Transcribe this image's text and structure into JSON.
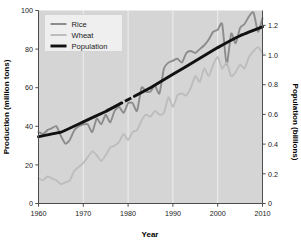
{
  "chart_data": {
    "type": "line",
    "title": "",
    "xlabel": "Year",
    "ylabel": "Production (million tons)",
    "y2label": "Population (billions)",
    "xlim": [
      1960,
      2010
    ],
    "ylim": [
      0,
      100
    ],
    "y2lim": [
      0,
      1.3
    ],
    "grid": "vertical gridlines at each decade, white on gray panel",
    "legend_position": "top-left inside axes",
    "xticks": [
      "1960",
      "1970",
      "1980",
      "1990",
      "2000",
      "2010"
    ],
    "xtick_values": [
      1960,
      1970,
      1980,
      1990,
      2000,
      2010
    ],
    "yticks": [
      "0",
      "20",
      "40",
      "60",
      "80",
      "100"
    ],
    "ytick_values": [
      0,
      20,
      40,
      60,
      80,
      100
    ],
    "y2ticks": [
      "0",
      "0.2",
      "0.4",
      "0.6",
      "0.8",
      "1.0",
      "1.2"
    ],
    "y2tick_values": [
      0,
      0.2,
      0.4,
      0.6,
      0.8,
      1.0,
      1.2
    ],
    "colors": {
      "rice": "#8c8c8c",
      "wheat": "#bdbdbd",
      "population": "#111111",
      "panel_background": "#d5d5d5",
      "gridline": "#f2f2f2",
      "axis": "#4d4d4d",
      "legend_background": "#efefef"
    },
    "series": [
      {
        "name": "Rice",
        "axis": "left",
        "unit": "million tons",
        "x": [
          1960,
          1961,
          1962,
          1963,
          1964,
          1965,
          1966,
          1967,
          1968,
          1969,
          1970,
          1971,
          1972,
          1973,
          1974,
          1975,
          1976,
          1977,
          1978,
          1979,
          1980,
          1981,
          1982,
          1983,
          1984,
          1985,
          1986,
          1987,
          1988,
          1989,
          1990,
          1991,
          1992,
          1993,
          1994,
          1995,
          1996,
          1997,
          1998,
          1999,
          2000,
          2001,
          2002,
          2003,
          2004,
          2005,
          2006,
          2007,
          2008,
          2009,
          2010
        ],
        "values": [
          37,
          36,
          38,
          39,
          40,
          35,
          31,
          33,
          38,
          40,
          41,
          41,
          37,
          44,
          41,
          46,
          42,
          48,
          50,
          47,
          52,
          52,
          48,
          60,
          58,
          58,
          61,
          57,
          70,
          73,
          74,
          75,
          73,
          78,
          79,
          78,
          80,
          82,
          85,
          89,
          90,
          93,
          72,
          88,
          83,
          91,
          93,
          97,
          99,
          89,
          96
        ]
      },
      {
        "name": "Wheat",
        "axis": "left",
        "unit": "million tons",
        "x": [
          1960,
          1961,
          1962,
          1963,
          1964,
          1965,
          1966,
          1967,
          1968,
          1969,
          1970,
          1971,
          1972,
          1973,
          1974,
          1975,
          1976,
          1977,
          1978,
          1979,
          1980,
          1981,
          1982,
          1983,
          1984,
          1985,
          1986,
          1987,
          1988,
          1989,
          1990,
          1991,
          1992,
          1993,
          1994,
          1995,
          1996,
          1997,
          1998,
          1999,
          2000,
          2001,
          2002,
          2003,
          2004,
          2005,
          2006,
          2007,
          2008,
          2009,
          2010
        ],
        "values": [
          13,
          12,
          14,
          13,
          12,
          10,
          11,
          12,
          17,
          19,
          21,
          24,
          27,
          25,
          22,
          25,
          29,
          30,
          32,
          36,
          33,
          37,
          38,
          43,
          46,
          45,
          48,
          46,
          47,
          55,
          50,
          56,
          57,
          56,
          60,
          66,
          63,
          70,
          66,
          72,
          76,
          70,
          73,
          66,
          68,
          72,
          70,
          76,
          79,
          81,
          78
        ]
      },
      {
        "name": "Population",
        "axis": "right",
        "unit": "billions",
        "x": [
          1960,
          1965,
          1970,
          1975,
          1980,
          1985,
          1990,
          1995,
          2000,
          2005,
          2010
        ],
        "values": [
          0.45,
          0.48,
          0.55,
          0.62,
          0.7,
          0.78,
          0.87,
          0.96,
          1.05,
          1.13,
          1.19
        ],
        "note": "solid thick black line with a small dash break near 1979-1981"
      }
    ]
  },
  "legend": {
    "items": [
      {
        "label": "Rice",
        "color": "#8c8c8c"
      },
      {
        "label": "Wheat",
        "color": "#bdbdbd"
      },
      {
        "label": "Population",
        "color": "#111111"
      }
    ]
  },
  "axes": {
    "x_title": "Year",
    "y_left_title": "Production (million tons)",
    "y_right_title": "Population (billions)"
  }
}
